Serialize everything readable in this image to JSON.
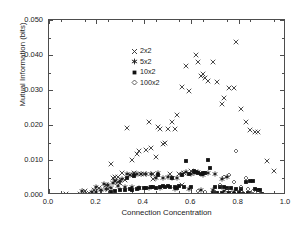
{
  "chart_data": {
    "type": "scatter",
    "title": "",
    "xlabel": "Connection Concentration",
    "ylabel": "Mutual Information (bits)",
    "xlim": [
      0.0,
      1.0
    ],
    "ylim": [
      0.0,
      0.05
    ],
    "xticks": [
      "0.0",
      "0.2",
      "0.4",
      "0.6",
      "0.8",
      "1.0"
    ],
    "xtick_values": [
      0.0,
      0.2,
      0.4,
      0.6,
      0.8,
      1.0
    ],
    "yticks": [
      "0.000",
      "0.010",
      "0.020",
      "0.030",
      "0.040",
      "0.050"
    ],
    "ytick_values": [
      0.0,
      0.01,
      0.02,
      0.03,
      0.04,
      0.05
    ],
    "grid": false,
    "legend_position": "upper-left-inside",
    "series": [
      {
        "name": "2x2",
        "marker": "cross",
        "color": "#2b2b2b",
        "points": [
          [
            0.07,
            0.0002
          ],
          [
            0.13,
            0.0004
          ],
          [
            0.15,
            0.0012
          ],
          [
            0.17,
            0.0006
          ],
          [
            0.19,
            0.0015
          ],
          [
            0.21,
            0.002
          ],
          [
            0.22,
            0.001
          ],
          [
            0.24,
            0.0028
          ],
          [
            0.25,
            0.0018
          ],
          [
            0.26,
            0.009
          ],
          [
            0.27,
            0.0048
          ],
          [
            0.28,
            0.004
          ],
          [
            0.29,
            0.0051
          ],
          [
            0.3,
            0.0035
          ],
          [
            0.31,
            0.0062
          ],
          [
            0.32,
            0.0042
          ],
          [
            0.33,
            0.0192
          ],
          [
            0.34,
            0.0058
          ],
          [
            0.35,
            0.01
          ],
          [
            0.36,
            0.0062
          ],
          [
            0.37,
            0.0118
          ],
          [
            0.38,
            0.0125
          ],
          [
            0.39,
            0.006
          ],
          [
            0.4,
            0.0059
          ],
          [
            0.41,
            0.013
          ],
          [
            0.42,
            0.021
          ],
          [
            0.43,
            0.0135
          ],
          [
            0.44,
            0.006
          ],
          [
            0.45,
            0.011
          ],
          [
            0.46,
            0.0195
          ],
          [
            0.47,
            0.0189
          ],
          [
            0.48,
            0.0147
          ],
          [
            0.49,
            0.015
          ],
          [
            0.5,
            0.019
          ],
          [
            0.51,
            0.006
          ],
          [
            0.52,
            0.021
          ],
          [
            0.53,
            0.0189
          ],
          [
            0.54,
            0.0228
          ],
          [
            0.55,
            0.006
          ],
          [
            0.56,
            0.0308
          ],
          [
            0.57,
            0.0063
          ],
          [
            0.58,
            0.0368
          ],
          [
            0.59,
            0.0296
          ],
          [
            0.6,
            0.007
          ],
          [
            0.62,
            0.0399
          ],
          [
            0.63,
            0.038
          ],
          [
            0.64,
            0.034
          ],
          [
            0.65,
            0.0345
          ],
          [
            0.66,
            0.0335
          ],
          [
            0.67,
            0.0325
          ],
          [
            0.69,
            0.0379
          ],
          [
            0.71,
            0.0324
          ],
          [
            0.73,
            0.0259
          ],
          [
            0.74,
            0.0277
          ],
          [
            0.76,
            0.0306
          ],
          [
            0.78,
            0.0307
          ],
          [
            0.79,
            0.0437
          ],
          [
            0.81,
            0.0247
          ],
          [
            0.83,
            0.0208
          ],
          [
            0.85,
            0.0186
          ],
          [
            0.87,
            0.018
          ],
          [
            0.88,
            0.0179
          ],
          [
            0.92,
            0.0098
          ],
          [
            0.95,
            0.0068
          ],
          [
            0.28,
            0.0052
          ],
          [
            0.29,
            0.0036
          ],
          [
            0.44,
            0.0045
          ],
          [
            0.56,
            0.003
          ]
        ]
      },
      {
        "name": "5x2",
        "marker": "star",
        "color": "#1a1a1a",
        "points": [
          [
            0.14,
            0.0012
          ],
          [
            0.18,
            0.0009
          ],
          [
            0.2,
            0.0022
          ],
          [
            0.23,
            0.0031
          ],
          [
            0.25,
            0.003
          ],
          [
            0.27,
            0.0035
          ],
          [
            0.28,
            0.0039
          ],
          [
            0.3,
            0.0041
          ],
          [
            0.31,
            0.0047
          ],
          [
            0.33,
            0.006
          ],
          [
            0.34,
            0.0058
          ],
          [
            0.36,
            0.006
          ],
          [
            0.37,
            0.0059
          ],
          [
            0.39,
            0.006
          ],
          [
            0.41,
            0.006
          ],
          [
            0.43,
            0.0059
          ],
          [
            0.45,
            0.005
          ],
          [
            0.46,
            0.0062
          ],
          [
            0.48,
            0.005
          ],
          [
            0.5,
            0.0052
          ],
          [
            0.52,
            0.005
          ],
          [
            0.54,
            0.0049
          ],
          [
            0.56,
            0.006
          ],
          [
            0.58,
            0.0066
          ],
          [
            0.6,
            0.006
          ],
          [
            0.61,
            0.0063
          ],
          [
            0.63,
            0.0065
          ],
          [
            0.65,
            0.0058
          ],
          [
            0.67,
            0.0062
          ],
          [
            0.7,
            0.006
          ],
          [
            0.73,
            0.0045
          ],
          [
            0.75,
            0.0052
          ],
          [
            0.2,
            0.001
          ],
          [
            0.22,
            0.0015
          ],
          [
            0.24,
            0.0018
          ],
          [
            0.26,
            0.002
          ],
          [
            0.29,
            0.0025
          ],
          [
            0.32,
            0.0022
          ],
          [
            0.35,
            0.0024
          ],
          [
            0.38,
            0.0021
          ],
          [
            0.42,
            0.002
          ],
          [
            0.47,
            0.0019
          ],
          [
            0.53,
            0.0017
          ],
          [
            0.59,
            0.0016
          ],
          [
            0.64,
            0.0015
          ],
          [
            0.69,
            0.0014
          ],
          [
            0.74,
            0.0012
          ],
          [
            0.78,
            0.001
          ]
        ]
      },
      {
        "name": "10x2",
        "marker": "square",
        "color": "#111111",
        "points": [
          [
            0.26,
            0.0009
          ],
          [
            0.28,
            0.0011
          ],
          [
            0.3,
            0.0013
          ],
          [
            0.32,
            0.0014
          ],
          [
            0.34,
            0.0016
          ],
          [
            0.35,
            0.0015
          ],
          [
            0.37,
            0.0018
          ],
          [
            0.38,
            0.002
          ],
          [
            0.4,
            0.0019
          ],
          [
            0.41,
            0.0021
          ],
          [
            0.43,
            0.0022
          ],
          [
            0.44,
            0.0024
          ],
          [
            0.45,
            0.0021
          ],
          [
            0.47,
            0.0023
          ],
          [
            0.48,
            0.0025
          ],
          [
            0.49,
            0.0024
          ],
          [
            0.5,
            0.0026
          ],
          [
            0.51,
            0.0022
          ],
          [
            0.53,
            0.0024
          ],
          [
            0.54,
            0.002
          ],
          [
            0.55,
            0.0026
          ],
          [
            0.57,
            0.0023
          ],
          [
            0.58,
            0.0098
          ],
          [
            0.59,
            0.006
          ],
          [
            0.6,
            0.0022
          ],
          [
            0.61,
            0.007
          ],
          [
            0.62,
            0.0066
          ],
          [
            0.63,
            0.0064
          ],
          [
            0.64,
            0.006
          ],
          [
            0.65,
            0.0062
          ],
          [
            0.66,
            0.0064
          ],
          [
            0.67,
            0.01
          ],
          [
            0.68,
            0.0078
          ],
          [
            0.7,
            0.0024
          ],
          [
            0.72,
            0.0023
          ],
          [
            0.74,
            0.0022
          ],
          [
            0.75,
            0.0021
          ],
          [
            0.77,
            0.002
          ],
          [
            0.79,
            0.0018
          ],
          [
            0.81,
            0.0017
          ],
          [
            0.83,
            0.0038
          ],
          [
            0.85,
            0.004
          ],
          [
            0.86,
            0.0039
          ],
          [
            0.87,
            0.0016
          ],
          [
            0.88,
            0.0015
          ],
          [
            0.89,
            0.0013
          ],
          [
            0.36,
            0.0055
          ],
          [
            0.33,
            0.005
          ],
          [
            0.46,
            0.0056
          ],
          [
            0.52,
            0.005
          ],
          [
            0.56,
            0.0058
          ],
          [
            0.69,
            0.0006
          ],
          [
            0.71,
            0.0005
          ],
          [
            0.73,
            0.0006
          ],
          [
            0.76,
            0.0005
          ],
          [
            0.78,
            0.0004
          ],
          [
            0.8,
            0.0005
          ],
          [
            0.82,
            0.0004
          ],
          [
            0.84,
            0.0005
          ],
          [
            0.9,
            0.0004
          ]
        ]
      },
      {
        "name": "100x2",
        "marker": "diamond",
        "color": "#333333",
        "points": [
          [
            0.02,
            0.0
          ],
          [
            0.04,
            0.0
          ],
          [
            0.06,
            0.0
          ],
          [
            0.08,
            0.0
          ],
          [
            0.1,
            0.0
          ],
          [
            0.12,
            0.0
          ],
          [
            0.14,
            0.0
          ],
          [
            0.16,
            0.0
          ],
          [
            0.18,
            0.0
          ],
          [
            0.2,
            0.0
          ],
          [
            0.22,
            0.0
          ],
          [
            0.24,
            0.0
          ],
          [
            0.26,
            0.0
          ],
          [
            0.28,
            0.0
          ],
          [
            0.3,
            0.0
          ],
          [
            0.32,
            0.0
          ],
          [
            0.34,
            0.0
          ],
          [
            0.36,
            0.0
          ],
          [
            0.38,
            0.0
          ],
          [
            0.4,
            0.0
          ],
          [
            0.42,
            0.0
          ],
          [
            0.44,
            0.0
          ],
          [
            0.46,
            0.0
          ],
          [
            0.48,
            0.0
          ],
          [
            0.5,
            0.0
          ],
          [
            0.52,
            0.0
          ],
          [
            0.54,
            0.0
          ],
          [
            0.56,
            0.0
          ],
          [
            0.58,
            0.0
          ],
          [
            0.6,
            0.0
          ],
          [
            0.62,
            0.0
          ],
          [
            0.64,
            0.0
          ],
          [
            0.66,
            0.0
          ],
          [
            0.68,
            0.0
          ],
          [
            0.7,
            0.0
          ],
          [
            0.72,
            0.0
          ],
          [
            0.74,
            0.0
          ],
          [
            0.76,
            0.0
          ],
          [
            0.78,
            0.0
          ],
          [
            0.8,
            0.0
          ],
          [
            0.82,
            0.0
          ],
          [
            0.84,
            0.0
          ],
          [
            0.86,
            0.0
          ],
          [
            0.88,
            0.0
          ],
          [
            0.9,
            0.0
          ],
          [
            0.92,
            0.0
          ],
          [
            0.94,
            0.0
          ],
          [
            0.96,
            0.0
          ],
          [
            0.98,
            0.0
          ],
          [
            0.03,
            0.0
          ],
          [
            0.05,
            0.0
          ],
          [
            0.07,
            0.0
          ],
          [
            0.09,
            0.0
          ],
          [
            0.11,
            0.0
          ],
          [
            0.13,
            0.0
          ],
          [
            0.15,
            0.0
          ],
          [
            0.17,
            0.0
          ],
          [
            0.19,
            0.0
          ],
          [
            0.21,
            0.0
          ],
          [
            0.23,
            0.0
          ],
          [
            0.25,
            0.0
          ],
          [
            0.27,
            0.0
          ],
          [
            0.29,
            0.0
          ],
          [
            0.31,
            0.0
          ],
          [
            0.33,
            0.0
          ],
          [
            0.35,
            0.0
          ],
          [
            0.37,
            0.0
          ],
          [
            0.39,
            0.0
          ],
          [
            0.41,
            0.0
          ],
          [
            0.43,
            0.0
          ],
          [
            0.45,
            0.0
          ],
          [
            0.47,
            0.0
          ],
          [
            0.49,
            0.0
          ],
          [
            0.51,
            0.0
          ],
          [
            0.53,
            0.0
          ],
          [
            0.55,
            0.0
          ],
          [
            0.57,
            0.0
          ],
          [
            0.59,
            0.0
          ],
          [
            0.61,
            0.0
          ],
          [
            0.63,
            0.0
          ],
          [
            0.65,
            0.0
          ],
          [
            0.67,
            0.0
          ],
          [
            0.69,
            0.0
          ],
          [
            0.71,
            0.0
          ],
          [
            0.73,
            0.0
          ],
          [
            0.75,
            0.0
          ],
          [
            0.77,
            0.0
          ],
          [
            0.79,
            0.0
          ],
          [
            0.81,
            0.0
          ],
          [
            0.83,
            0.0
          ],
          [
            0.85,
            0.0
          ],
          [
            0.87,
            0.0
          ],
          [
            0.89,
            0.0
          ],
          [
            0.91,
            0.0
          ],
          [
            0.93,
            0.0
          ],
          [
            0.95,
            0.0
          ],
          [
            0.97,
            0.0
          ],
          [
            0.99,
            0.0
          ],
          [
            0.63,
            0.0012
          ],
          [
            0.66,
            0.0008
          ],
          [
            0.7,
            0.001
          ],
          [
            0.72,
            0.003
          ],
          [
            0.74,
            0.0052
          ],
          [
            0.75,
            0.0013
          ],
          [
            0.76,
            0.0058
          ],
          [
            0.78,
            0.0036
          ],
          [
            0.79,
            0.0127
          ],
          [
            0.81,
            0.0022
          ],
          [
            0.83,
            0.0049
          ],
          [
            0.84,
            0.0018
          ],
          [
            0.86,
            0.0012
          ],
          [
            0.88,
            0.001
          ],
          [
            0.73,
            0.0005
          ],
          [
            0.77,
            0.0006
          ],
          [
            0.8,
            0.0008
          ],
          [
            0.82,
            0.0007
          ],
          [
            0.85,
            0.0006
          ]
        ]
      }
    ]
  },
  "legend": {
    "items": [
      {
        "label": "2x2",
        "marker": "cross-marker-icon"
      },
      {
        "label": "5x2",
        "marker": "star-marker-icon"
      },
      {
        "label": "10x2",
        "marker": "square-marker-icon"
      },
      {
        "label": "100x2",
        "marker": "diamond-marker-icon"
      }
    ]
  },
  "colors": {
    "axis": "#4d4d4d",
    "text": "#1a1a1a",
    "background": "#ffffff"
  }
}
